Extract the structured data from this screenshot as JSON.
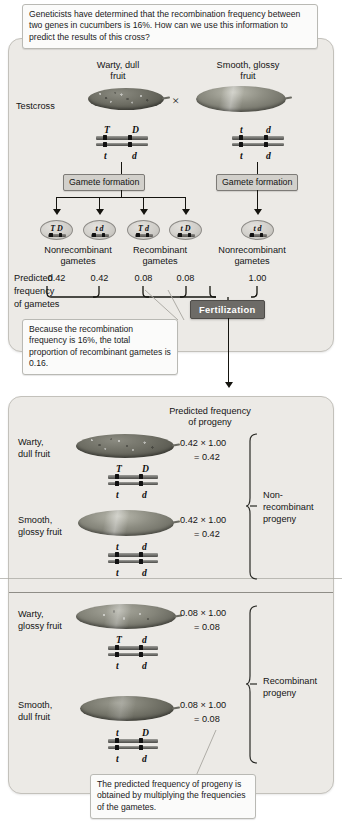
{
  "figure": {
    "question_callout": "Geneticists have determined that the recombination frequency between two genes in cucumbers is 16%.  How can we use this information to predict the results of this cross?",
    "recombination_note": "Because the recombination frequency is 16%, the total proportion of recombinant gametes is 0.16.",
    "progeny_note": "The predicted frequency of progeny is obtained by multiplying the frequencies of the gametes."
  },
  "cross": {
    "label": "Testcross",
    "times_symbol": "×",
    "parent_left": {
      "name_line1": "Warty, dull",
      "name_line2": "fruit",
      "genotype_top_left": "T",
      "genotype_top_right": "D",
      "genotype_bottom_left": "t",
      "genotype_bottom_right": "d",
      "phenotype_icon": "warty-dull-cucumber"
    },
    "parent_right": {
      "name_line1": "Smooth, glossy",
      "name_line2": "fruit",
      "genotype_top_left": "t",
      "genotype_top_right": "d",
      "genotype_bottom_left": "t",
      "genotype_bottom_right": "d",
      "phenotype_icon": "smooth-glossy-cucumber"
    },
    "gamete_formation_label": "Gamete formation",
    "fertilization_label": "Fertilization"
  },
  "gametes": {
    "predicted_label_line1": "Predicted",
    "predicted_label_line2": "frequency",
    "predicted_label_line3": "of gametes",
    "items": [
      {
        "left": "T",
        "right": "D",
        "frequency": "0.42"
      },
      {
        "left": "t",
        "right": "d",
        "frequency": "0.42"
      },
      {
        "left": "T",
        "right": "d",
        "frequency": "0.08"
      },
      {
        "left": "t",
        "right": "D",
        "frequency": "0.08"
      },
      {
        "left": "t",
        "right": "d",
        "frequency": "1.00"
      }
    ],
    "group_labels": [
      {
        "line1": "Nonrecombinant",
        "line2": "gametes"
      },
      {
        "line1": "Recombinant",
        "line2": "gametes"
      },
      {
        "line1": "Nonrecombinant",
        "line2": "gametes"
      }
    ]
  },
  "progeny": {
    "heading_line1": "Predicted frequency",
    "heading_line2": "of progeny",
    "rows": [
      {
        "phenotype_line1": "Warty,",
        "phenotype_line2": "dull fruit",
        "icon": "warty-dull-cucumber",
        "calculation": "0.42 × 1.00",
        "result": "= 0.42",
        "genotype_top_left": "T",
        "genotype_top_right": "D",
        "genotype_bottom_left": "t",
        "genotype_bottom_right": "d"
      },
      {
        "phenotype_line1": "Smooth,",
        "phenotype_line2": "glossy fruit",
        "icon": "smooth-glossy-cucumber",
        "calculation": "0.42 × 1.00",
        "result": "= 0.42",
        "genotype_top_left": "t",
        "genotype_top_right": "d",
        "genotype_bottom_left": "t",
        "genotype_bottom_right": "d"
      },
      {
        "phenotype_line1": "Warty,",
        "phenotype_line2": "glossy fruit",
        "icon": "warty-glossy-cucumber",
        "calculation": "0.08 × 1.00",
        "result": "= 0.08",
        "genotype_top_left": "T",
        "genotype_top_right": "d",
        "genotype_bottom_left": "t",
        "genotype_bottom_right": "d"
      },
      {
        "phenotype_line1": "Smooth,",
        "phenotype_line2": "dull fruit",
        "icon": "smooth-dull-cucumber",
        "calculation": "0.08 × 1.00",
        "result": "= 0.08",
        "genotype_top_left": "t",
        "genotype_top_right": "D",
        "genotype_bottom_left": "t",
        "genotype_bottom_right": "d"
      }
    ],
    "group_labels": [
      {
        "line1": "Non-",
        "line2": "recombinant",
        "line3": "progeny"
      },
      {
        "line1": "Recombinant",
        "line2": "progeny",
        "line3": ""
      }
    ]
  },
  "colors": {
    "panel_fill": "#eceae6",
    "panel_border": "#c3c1bb",
    "process_box_fill": "#d2d0cb",
    "fertilization_fill": "#6d6b67",
    "ink": "#15140f"
  }
}
